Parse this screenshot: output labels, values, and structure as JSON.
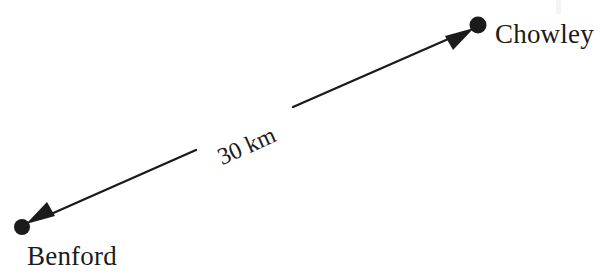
{
  "diagram": {
    "type": "distance-arrow-diagram",
    "background_color": "#ffffff",
    "stroke_color": "#1b1b1b",
    "nodes": [
      {
        "id": "benford",
        "label": "Benford",
        "marker": "filled-dot",
        "x": 22,
        "y": 227
      },
      {
        "id": "chowley",
        "label": "Chowley",
        "marker": "filled-dot",
        "x": 478,
        "y": 25
      }
    ],
    "connector": {
      "style": "double-headed-arrow",
      "from": "benford",
      "to": "chowley",
      "label": "30 km",
      "label_rotation_degrees": -23.9,
      "line_gap_for_label": true
    }
  },
  "labels": {
    "chowley": "Chowley",
    "benford": "Benford",
    "distance": "30 km"
  }
}
